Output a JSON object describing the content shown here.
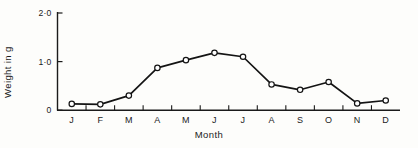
{
  "chart_data": {
    "type": "line",
    "title": "",
    "xlabel": "Month",
    "ylabel": "Weight in g",
    "categories": [
      "J",
      "F",
      "M",
      "A",
      "M",
      "J",
      "J",
      "A",
      "S",
      "O",
      "N",
      "D"
    ],
    "category_names": [
      "January",
      "February",
      "March",
      "April",
      "May",
      "June",
      "July",
      "August",
      "September",
      "October",
      "November",
      "December"
    ],
    "values": [
      0.13,
      0.12,
      0.3,
      0.87,
      1.03,
      1.18,
      1.1,
      0.53,
      0.42,
      0.58,
      0.14,
      0.2
    ],
    "ylim": [
      0,
      2.0
    ],
    "ytick_values": [
      0,
      1.0,
      2.0
    ],
    "ytick_labels": [
      "0",
      "1·0",
      "2·0"
    ],
    "xtick_labels": [
      "J",
      "F",
      "M",
      "A",
      "M",
      "J",
      "J",
      "A",
      "S",
      "O",
      "N",
      "D"
    ],
    "grid": false,
    "legend": null,
    "marker": "open-circle",
    "line_color": "#141414",
    "marker_fill": "#ffffff",
    "marker_edge": "#141414",
    "axis_color": "#1b1b1b",
    "background_color": "#fdfdfb",
    "series": [
      {
        "name": "Weight",
        "values": [
          0.13,
          0.12,
          0.3,
          0.87,
          1.03,
          1.18,
          1.1,
          0.53,
          0.42,
          0.58,
          0.14,
          0.2
        ]
      }
    ]
  }
}
